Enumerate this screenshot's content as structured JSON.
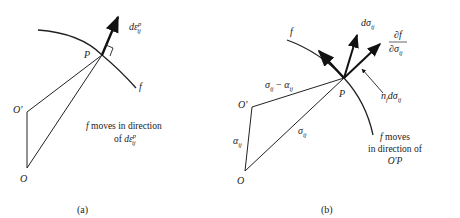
{
  "panel_a": {
    "caption": "(a)",
    "points": {
      "O": "O",
      "O_prime": "O'",
      "P": "P"
    },
    "surface_label": "f",
    "vector_label": {
      "base": "dε",
      "sup": "p",
      "sub": "ij"
    },
    "note_line1": "f moves in direction",
    "note_line2_prefix": "of ",
    "note_line2_base": "dε",
    "note_line2_sup": "p",
    "note_line2_sub": "ij"
  },
  "panel_b": {
    "caption": "(b)",
    "points": {
      "O": "O",
      "O_prime": "O'",
      "P": "P"
    },
    "surface_label": "f",
    "vector_dsigma": {
      "base": "dσ",
      "sub": "ij"
    },
    "vector_gradient": {
      "numerator": "∂f",
      "denominator": "∂σ",
      "sub": "ij"
    },
    "normal_component": {
      "base": "n",
      "sub1": "f",
      "mid": "dσ",
      "sub2": "ij"
    },
    "segment_labels": {
      "o_prime_to_p": {
        "a": "σ",
        "a_sub": "ij",
        "op": " − ",
        "b": "α",
        "b_sub": "ij"
      },
      "o_to_o_prime": {
        "base": "α",
        "sub": "ij"
      },
      "o_to_p": {
        "base": "σ",
        "sub": "ij"
      }
    },
    "note_line1": "f moves",
    "note_line2": "in direction of",
    "note_line3": "O'P"
  }
}
